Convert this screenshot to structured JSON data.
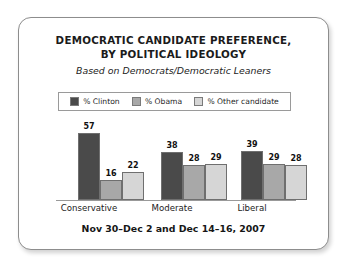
{
  "chart_data": {
    "type": "bar",
    "title": "DEMOCRATIC CANDIDATE PREFERENCE, BY POLITICAL IDEOLOGY",
    "title_line1": "DEMOCRATIC CANDIDATE PREFERENCE,",
    "title_line2": "BY POLITICAL IDEOLOGY",
    "subtitle": "Based on Democrats/Democratic Leaners",
    "footer": "Nov 30–Dec 2 and Dec 14–16, 2007",
    "categories": [
      "Conservative",
      "Moderate",
      "Liberal"
    ],
    "series": [
      {
        "name": "% Clinton",
        "values": [
          57,
          38,
          39
        ],
        "color": "#4a4a4a"
      },
      {
        "name": "% Obama",
        "values": [
          16,
          28,
          29
        ],
        "color": "#a8a8a8"
      },
      {
        "name": "% Other candidate",
        "values": [
          22,
          29,
          28
        ],
        "color": "#d6d6d6"
      }
    ],
    "xlabel": "",
    "ylabel": "",
    "ylim": [
      0,
      62
    ],
    "grid": false,
    "legend_position": "top",
    "value_labels": true,
    "axis_line_color": "#999999",
    "card_border_color": "#8d8d8d"
  },
  "legend": {
    "items": [
      {
        "label": "% Clinton",
        "color": "#4a4a4a"
      },
      {
        "label": "% Obama",
        "color": "#a8a8a8"
      },
      {
        "label": "% Other candidate",
        "color": "#d6d6d6"
      }
    ]
  }
}
